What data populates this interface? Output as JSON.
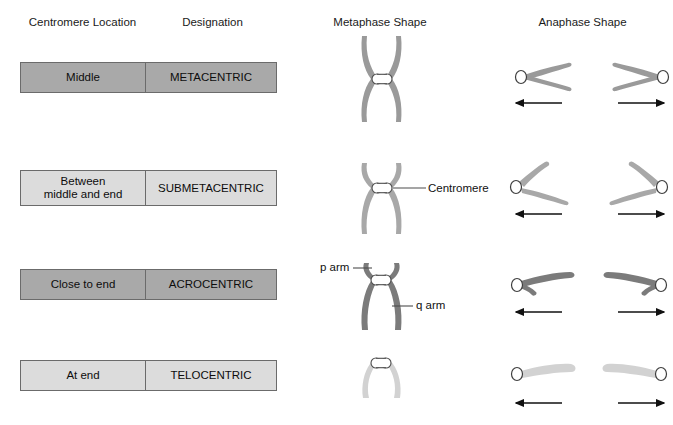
{
  "figure": {
    "columns": [
      {
        "id": "centromere-location",
        "label": "Centromere Location"
      },
      {
        "id": "designation",
        "label": "Designation"
      },
      {
        "id": "metaphase-shape",
        "label": "Metaphase Shape"
      },
      {
        "id": "anaphase-shape",
        "label": "Anaphase Shape"
      }
    ],
    "rows": [
      {
        "id": "metacentric",
        "location": "Middle",
        "designation": "METACENTRIC",
        "row_shade": "dark",
        "chromatid_color": "#9a9a9a",
        "arm_ratio": "equal arms",
        "centromere_position": "middle"
      },
      {
        "id": "submetacentric",
        "location": "Between\nmiddle and end",
        "location_line1": "Between",
        "location_line2": "middle and end",
        "designation": "SUBMETACENTRIC",
        "row_shade": "light",
        "chromatid_color": "#a8a8a8",
        "arm_ratio": "short p arm, long q arm",
        "centromere_position": "between middle and end"
      },
      {
        "id": "acrocentric",
        "location": "Close to end",
        "designation": "ACROCENTRIC",
        "row_shade": "dark",
        "chromatid_color": "#7b7b7b",
        "arm_ratio": "very short p arm, long q arm",
        "centromere_position": "close to end"
      },
      {
        "id": "telocentric",
        "location": "At end",
        "designation": "TELOCENTRIC",
        "row_shade": "light",
        "chromatid_color": "#d2d2d2",
        "arm_ratio": "no p arm",
        "centromere_position": "at end"
      }
    ],
    "annotations": [
      {
        "id": "centromere",
        "text": "Centromere",
        "points_to": "centromere of submetacentric metaphase chromosome"
      },
      {
        "id": "p-arm",
        "text": "p arm",
        "points_to": "short arm of acrocentric metaphase chromosome"
      },
      {
        "id": "q-arm",
        "text": "q arm",
        "points_to": "long arm of acrocentric metaphase chromosome"
      }
    ],
    "anaphase_arrows": [
      {
        "id": "arrow-left",
        "direction": "left",
        "meaning": "movement toward pole"
      },
      {
        "id": "arrow-right",
        "direction": "right",
        "meaning": "movement toward pole"
      }
    ],
    "colors": {
      "box_border": "#6b6b6b",
      "shade_dark": "#a9a9a9",
      "shade_light": "#dcdcdc",
      "centromere_fill": "#ffffff",
      "centromere_stroke": "#4d4d4d",
      "arrow": "#111111",
      "text": "#111111"
    }
  }
}
